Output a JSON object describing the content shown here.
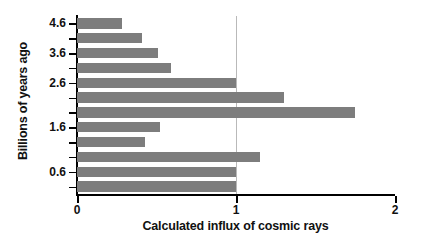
{
  "chart_data": {
    "type": "bar",
    "orientation": "horizontal",
    "title": "",
    "xlabel": "Calculated influx of cosmic rays",
    "ylabel": "Billions of years ago",
    "xlim": [
      0,
      2
    ],
    "xticks": [
      0,
      1,
      2
    ],
    "xtick_labels": [
      "0",
      "1",
      "2"
    ],
    "yticks": [
      4.6,
      4.2,
      3.6,
      3.2,
      2.6,
      2.2,
      1.9,
      1.6,
      1.2,
      0.9,
      0.6,
      0.2
    ],
    "ytick_labels": [
      "4.6",
      "",
      "3.6",
      "",
      "2.6",
      "",
      "",
      "1.6",
      "",
      "",
      "0.6",
      ""
    ],
    "visible_ytick_labels": [
      "4.6",
      "3.6",
      "2.6",
      "1.6",
      "0.6"
    ],
    "categories": [
      "4.6",
      "4.2",
      "3.6",
      "3.2",
      "2.6",
      "2.2",
      "1.9",
      "1.6",
      "1.2",
      "0.9",
      "0.6",
      "0.2"
    ],
    "values": [
      0.28,
      0.41,
      0.51,
      0.59,
      1.0,
      1.3,
      1.75,
      0.52,
      0.43,
      1.15,
      1.0,
      1.0
    ],
    "grid": "vertical-at-1",
    "gridlines_x": [
      1
    ],
    "legend": "none",
    "bar_color": "#7d7d7d",
    "axis_color": "#000000",
    "gridline_color": "#b9b9b9",
    "background": "#ffffff"
  }
}
